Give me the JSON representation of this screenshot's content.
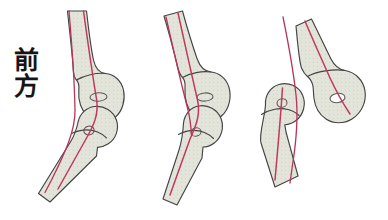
{
  "figure": {
    "label_anterior": "前\n方",
    "label_anterior_reading": "zenpou (anterior / front)",
    "background_color": "#ffffff",
    "bone_fill_color": "#e2e4da",
    "bone_outline_color": "#444444",
    "axis_line_color": "#c03a5c",
    "reference_line_color": "#b8355a",
    "hole_fill_color": "#ffffff",
    "panel_count": 3
  },
  "panels": [
    {
      "id": "panel-1",
      "name": "normal-alignment",
      "order": 1,
      "description": "Joint in normal alignment: distal bone axis continues through proximal bone axis",
      "upper_bone": {
        "name": "proximal-bone-shaft",
        "condyle": "distal-condyle",
        "foramen": "nutrient-foramen-ellipse"
      },
      "lower_bone": {
        "name": "distal-bone-shaft",
        "head": "proximal-head",
        "foramen": "nutrient-foramen-ellipse"
      },
      "axis_line": "bone-axis-line",
      "reference_line": "vertical-reference-line"
    },
    {
      "id": "panel-2",
      "name": "partial-displacement",
      "order": 2,
      "description": "Joint partially displaced: distal bone axis deviates from proximal bone axis",
      "upper_bone": {
        "name": "proximal-bone-shaft",
        "condyle": "distal-condyle",
        "foramen": "nutrient-foramen-ellipse"
      },
      "lower_bone": {
        "name": "distal-bone-shaft",
        "head": "proximal-head",
        "foramen": "nutrient-foramen-ellipse"
      },
      "axis_line": "bone-axis-line",
      "reference_line": "vertical-reference-line"
    },
    {
      "id": "panel-3",
      "name": "complete-dislocation",
      "order": 3,
      "description": "Joint completely dislocated: distal bone separated and shifted anteriorly from condyle",
      "upper_bone": {
        "name": "proximal-bone-shaft",
        "condyle": "distal-condyle",
        "foramen": "nutrient-foramen-hole"
      },
      "lower_bone": {
        "name": "distal-bone-shaft",
        "head": "proximal-head",
        "foramen": "nutrient-foramen-ellipse"
      },
      "axis_line": "bone-axis-line",
      "reference_line": "vertical-reference-line"
    }
  ]
}
